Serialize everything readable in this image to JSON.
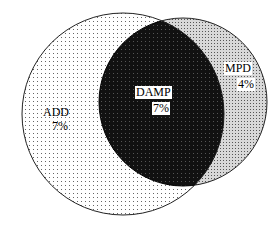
{
  "diagram": {
    "type": "venn",
    "sets": [
      {
        "name": "ADD",
        "value": "7%"
      },
      {
        "name": "DAMP",
        "value": "7%"
      },
      {
        "name": "MPD",
        "value": "4%"
      }
    ]
  }
}
